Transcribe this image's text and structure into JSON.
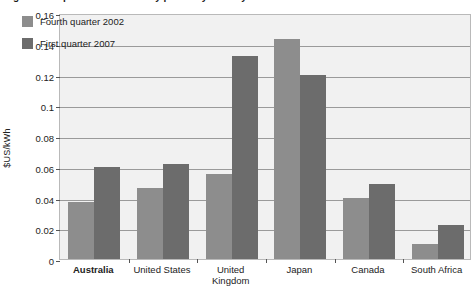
{
  "chart_data": {
    "type": "bar",
    "title": "Figure: Comparison of electricity prices by country",
    "xlabel": "",
    "ylabel": "$US/kWh",
    "ylim": [
      0,
      0.16
    ],
    "ytick_values": [
      0,
      0.02,
      0.04,
      0.06,
      0.08,
      0.1,
      0.12,
      0.14,
      0.16
    ],
    "ytick_labels": [
      "0",
      "0.02",
      "0.04",
      "0.06",
      "0.08",
      "0.1",
      "0.12",
      "0.14",
      "0.16"
    ],
    "grid": true,
    "legend_position": "top-left",
    "categories": [
      "Australia",
      "United States",
      "United Kingdom",
      "Japan",
      "Canada",
      "South Africa"
    ],
    "category_lines": [
      [
        "Australia"
      ],
      [
        "United States"
      ],
      [
        "United",
        "Kingdom"
      ],
      [
        "Japan"
      ],
      [
        "Canada"
      ],
      [
        "South Africa"
      ]
    ],
    "highlighted_category": "Australia",
    "series": [
      {
        "name": "Fourth quarter 2002",
        "color": "#8d8d8d",
        "values": [
          0.037,
          0.046,
          0.055,
          0.143,
          0.04,
          0.01
        ]
      },
      {
        "name": "First quarter 2007",
        "color": "#6c6c6c",
        "values": [
          0.06,
          0.062,
          0.132,
          0.12,
          0.049,
          0.022
        ]
      }
    ]
  },
  "colors": {
    "series_light": "#8d8d8d",
    "series_dark": "#6c6c6c",
    "plot_background": "#f1f1f1",
    "gridline": "#9a9a9a",
    "axis": "#555555",
    "text": "#222222"
  }
}
